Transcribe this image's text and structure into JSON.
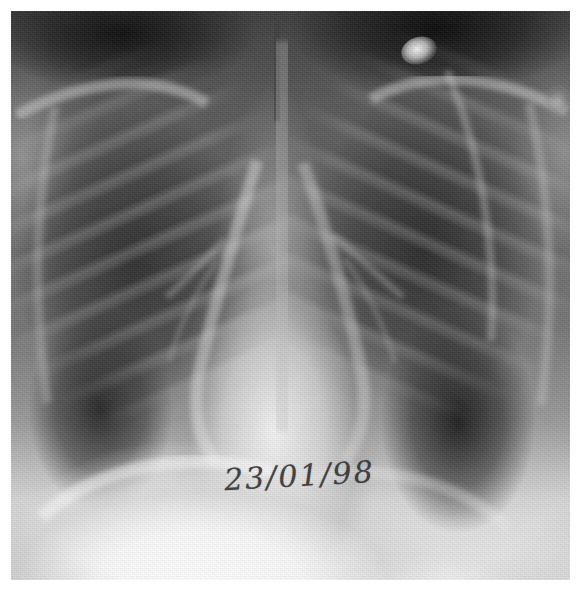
{
  "image": {
    "modality": "chest-radiograph",
    "view": "frontal-pa",
    "colorspace": "grayscale",
    "width": 588,
    "height": 593
  },
  "frame": {
    "border_color": "#ffffff",
    "film_left": 11,
    "film_top": 11,
    "film_width": 559,
    "film_height": 569
  },
  "annotation": {
    "date_text": "23/01/98",
    "ink_color": "#2a2a2e",
    "rotation_deg": -3.2
  },
  "palette": {
    "lung_dark": "#1e1e1e",
    "soft_tissue_mid": "#6a6a6a",
    "mediastinum_bright": "#e8e8e8",
    "diaphragm_bright": "#fbfbfb",
    "film_base": "#585858",
    "paper_white": "#ffffff"
  },
  "regions": {
    "right_lung_field": "dark-aerated",
    "left_lung_field": "dark-aerated",
    "mediastinum": "bright-opaque",
    "cardiac_silhouette": "bright-opaque",
    "right_hemidiaphragm": "bright-dome",
    "left_hemidiaphragm": "bright-dome",
    "costophrenic_recess_right": "dark-recess",
    "costophrenic_recess_left": "dark-recess",
    "apices": "dark",
    "nodular_opacity_upper_right": "bright-focal"
  }
}
